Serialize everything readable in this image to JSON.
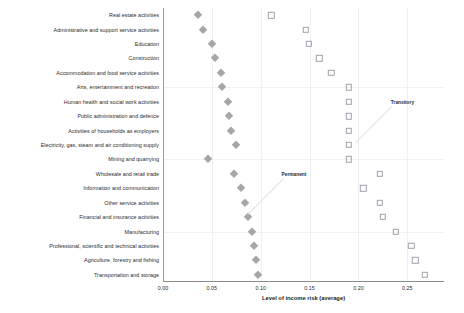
{
  "chart_data": {
    "type": "scatter",
    "title": "",
    "xlabel": "Level of income risk (average)",
    "ylabel": "",
    "xlim": [
      0.0,
      0.2875
    ],
    "xticks": [
      0.0,
      0.05,
      0.1,
      0.15,
      0.2,
      0.25
    ],
    "xticklabels": [
      "0.00",
      "0.05",
      "0.10",
      "0.15",
      "0.20",
      "0.25"
    ],
    "grid": "light vertical and horizontal gridlines",
    "legend_position": "none (inline annotations)",
    "categories": [
      "Real estate activities",
      "Administrative and support service activities",
      "Education",
      "Construction",
      "Accommodation and food service activities",
      "Arts, entertainment and recreation",
      "Human health and social work activities",
      "Public administration and defence",
      "Activities of households as employers",
      "Electricity, gas, steam and air conditioning supply",
      "Mining and quarrying",
      "Wholesale and retail trade",
      "Information and communication",
      "Other service activities",
      "Financial and insurance activities",
      "Manufacturing",
      "Professional, scientific and technical activities",
      "Agriculture, forestry and fishing",
      "Transportation and storage"
    ],
    "series": [
      {
        "name": "Permanent",
        "marker": "filled-diamond",
        "color": "#a6a6a6",
        "values": [
          0.036,
          0.041,
          0.05,
          0.053,
          0.059,
          0.06,
          0.066,
          0.068,
          0.07,
          0.075,
          0.046,
          0.073,
          0.08,
          0.084,
          0.087,
          0.091,
          0.093,
          0.095,
          0.097
        ]
      },
      {
        "name": "Transitory",
        "marker": "open-square",
        "color": "#9fa3ad",
        "values": [
          0.111,
          0.146,
          0.149,
          0.16,
          0.172,
          0.19,
          0.19,
          0.19,
          0.19,
          0.19,
          0.19,
          0.222,
          0.205,
          0.222,
          0.225,
          0.238,
          0.254,
          0.258,
          0.268
        ]
      }
    ],
    "annotations": [
      {
        "text": "Transitory",
        "x": 0.245,
        "y_row": 6
      },
      {
        "text": "Permanent",
        "x": 0.134,
        "y_row": 11
      }
    ]
  },
  "axis": {
    "x_title": "Level of income risk (average)"
  }
}
